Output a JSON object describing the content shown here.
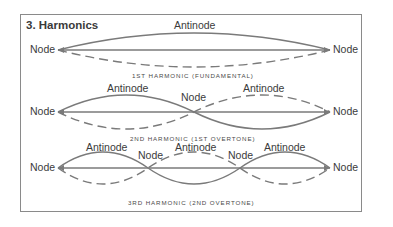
{
  "title": "3. Harmonics",
  "colors": {
    "line": "#7a7a7a",
    "text": "#3b3b3b",
    "frame": "#8a8a8a"
  },
  "harmonics": [
    {
      "caption": "1ST HARMONIC (FUNDAMENTAL)",
      "node_labels": [
        "Node",
        "Node"
      ],
      "antinode_labels": [
        "Antinode"
      ]
    },
    {
      "caption": "2ND HARMONIC (1ST OVERTONE)",
      "node_labels": [
        "Node",
        "Node",
        "Node"
      ],
      "antinode_labels": [
        "Antinode",
        "Antinode"
      ]
    },
    {
      "caption": "3RD HARMONIC (2ND OVERTONE)",
      "node_labels": [
        "Node",
        "Node",
        "Node",
        "Node"
      ],
      "antinode_labels": [
        "Antinode",
        "Antinode",
        "Antinode"
      ]
    }
  ]
}
